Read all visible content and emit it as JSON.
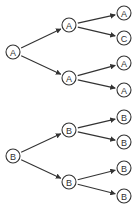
{
  "diagram": {
    "type": "tree",
    "nodes": [
      {
        "id": "a_root",
        "label": "A",
        "x": 13,
        "y": 52
      },
      {
        "id": "a_mid1",
        "label": "A",
        "x": 69,
        "y": 25
      },
      {
        "id": "a_mid2",
        "label": "A",
        "x": 69,
        "y": 78
      },
      {
        "id": "a_leaf1",
        "label": "A",
        "x": 124,
        "y": 13
      },
      {
        "id": "a_leaf2",
        "label": "C",
        "x": 124,
        "y": 38
      },
      {
        "id": "a_leaf3",
        "label": "A",
        "x": 124,
        "y": 63
      },
      {
        "id": "a_leaf4",
        "label": "A",
        "x": 124,
        "y": 90
      },
      {
        "id": "b_root",
        "label": "B",
        "x": 13,
        "y": 156
      },
      {
        "id": "b_mid1",
        "label": "B",
        "x": 69,
        "y": 130
      },
      {
        "id": "b_mid2",
        "label": "B",
        "x": 69,
        "y": 182
      },
      {
        "id": "b_leaf1",
        "label": "B",
        "x": 124,
        "y": 117
      },
      {
        "id": "b_leaf2",
        "label": "B",
        "x": 124,
        "y": 142
      },
      {
        "id": "b_leaf3",
        "label": "B",
        "x": 124,
        "y": 168
      },
      {
        "id": "b_leaf4",
        "label": "B",
        "x": 124,
        "y": 196
      }
    ],
    "edges": [
      [
        "a_root",
        "a_mid1"
      ],
      [
        "a_root",
        "a_mid2"
      ],
      [
        "a_mid1",
        "a_leaf1"
      ],
      [
        "a_mid1",
        "a_leaf2"
      ],
      [
        "a_mid2",
        "a_leaf3"
      ],
      [
        "a_mid2",
        "a_leaf4"
      ],
      [
        "b_root",
        "b_mid1"
      ],
      [
        "b_root",
        "b_mid2"
      ],
      [
        "b_mid1",
        "b_leaf1"
      ],
      [
        "b_mid1",
        "b_leaf2"
      ],
      [
        "b_mid2",
        "b_leaf3"
      ],
      [
        "b_mid2",
        "b_leaf4"
      ]
    ],
    "node_radius": 7,
    "colors": {
      "stroke": "#333333",
      "fill": "#ffffff",
      "background": "#ffffff"
    }
  }
}
